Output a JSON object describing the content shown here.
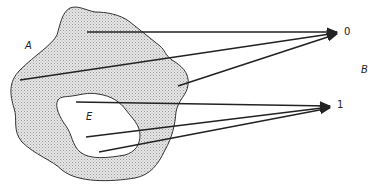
{
  "diagram": {
    "type": "set-mapping",
    "sets": {
      "A": {
        "label": "A",
        "shape": "irregular shaded region"
      },
      "E": {
        "label": "E",
        "shape": "irregular unshaded subregion inside A"
      },
      "B": {
        "label": "B",
        "elements": [
          "0",
          "1"
        ]
      }
    },
    "targets": {
      "zero": "0",
      "one": "1"
    },
    "arrows": [
      {
        "from": "A \\ E point 1",
        "to": "0"
      },
      {
        "from": "A \\ E point 2",
        "to": "0"
      },
      {
        "from": "A \\ E point 3",
        "to": "0"
      },
      {
        "from": "E point 1",
        "to": "1"
      },
      {
        "from": "E point 2",
        "to": "1"
      },
      {
        "from": "E point 3",
        "to": "1"
      }
    ],
    "colors": {
      "stroke": "#222222",
      "fill_A": "#d9d9d9",
      "fill_E": "#ffffff"
    }
  }
}
